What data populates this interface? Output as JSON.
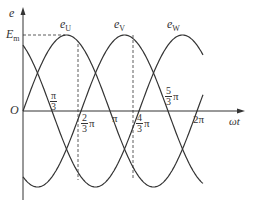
{
  "diagram": {
    "type": "three-phase-sinusoid",
    "axes": {
      "y_label": "e",
      "x_label": "ωt",
      "origin_label": "O",
      "amplitude_label": "E",
      "amplitude_sub": "m"
    },
    "curves": [
      {
        "name": "e",
        "sub": "U",
        "phase_deg": 0
      },
      {
        "name": "e",
        "sub": "V",
        "phase_deg": -120
      },
      {
        "name": "e",
        "sub": "W",
        "phase_deg": 120
      }
    ],
    "x_ticks": [
      {
        "num": "π",
        "den": "3",
        "suffix": ""
      },
      {
        "num": "2",
        "den": "3",
        "suffix": "π"
      },
      {
        "plain": "π"
      },
      {
        "num": "4",
        "den": "3",
        "suffix": "π"
      },
      {
        "num": "5",
        "den": "3",
        "suffix": "π"
      },
      {
        "plain": "2π"
      }
    ],
    "colors": {
      "line": "#333333",
      "background": "#ffffff"
    }
  }
}
